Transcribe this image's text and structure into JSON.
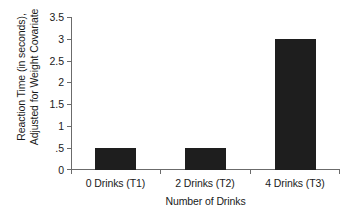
{
  "chart_data": {
    "type": "bar",
    "title": "",
    "categories": [
      "0 Drinks (T1)",
      "2 Drinks (T2)",
      "4 Drinks (T3)"
    ],
    "values": [
      0.5,
      0.5,
      3.0
    ],
    "xlabel": "Number of Drinks",
    "ylabel": "Reaction Time (in seconds), Adjusted for Weight Covariate",
    "ylabel_lines": [
      "Reaction Time (in seconds),",
      "Adjusted for Weight Covariate"
    ],
    "ylim": [
      0,
      3.5
    ],
    "ytick_values": [
      0,
      0.5,
      1,
      1.5,
      2,
      2.5,
      3,
      3.5
    ],
    "ytick_labels": [
      "0",
      ".5",
      "1",
      "1.5",
      "2",
      "2.5",
      "3",
      "3.5"
    ],
    "grid": false,
    "legend": null,
    "bar_color": "#1e1e1e",
    "axis_color": "#6b6b6b"
  }
}
